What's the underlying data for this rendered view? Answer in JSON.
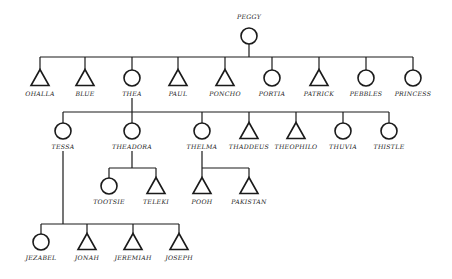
{
  "legend": {
    "circle": "female",
    "triangle": "male"
  },
  "root": {
    "name": "PEGGY",
    "shape": "circle",
    "x": 249,
    "y": 36
  },
  "generations": [
    {
      "bar_y": 57,
      "symbol_y": 78,
      "label_y": 96,
      "parent": "PEGGY",
      "members": [
        {
          "name": "OHALLA",
          "shape": "triangle",
          "x": 40
        },
        {
          "name": "BLUE",
          "shape": "triangle",
          "x": 85
        },
        {
          "name": "THEA",
          "shape": "circle",
          "x": 132
        },
        {
          "name": "PAUL",
          "shape": "triangle",
          "x": 178
        },
        {
          "name": "PONCHO",
          "shape": "triangle",
          "x": 225
        },
        {
          "name": "PORTIA",
          "shape": "circle",
          "x": 272
        },
        {
          "name": "PATRICK",
          "shape": "triangle",
          "x": 319
        },
        {
          "name": "PEBBLES",
          "shape": "circle",
          "x": 366
        },
        {
          "name": "PRINCESS",
          "shape": "circle",
          "x": 413
        }
      ]
    },
    {
      "bar_y": 112,
      "symbol_y": 131,
      "label_y": 149,
      "parent": "THEA",
      "members": [
        {
          "name": "TESSA",
          "shape": "circle",
          "x": 63
        },
        {
          "name": "THEADORA",
          "shape": "circle",
          "x": 132
        },
        {
          "name": "THELMA",
          "shape": "circle",
          "x": 202
        },
        {
          "name": "THADDEUS",
          "shape": "triangle",
          "x": 249
        },
        {
          "name": "THEOPHILO",
          "shape": "triangle",
          "x": 296
        },
        {
          "name": "THUVIA",
          "shape": "circle",
          "x": 343
        },
        {
          "name": "THISTLE",
          "shape": "circle",
          "x": 389
        }
      ]
    },
    {
      "bar_y": 168,
      "symbol_y": 186,
      "label_y": 204,
      "parent": "THEADORA",
      "members": [
        {
          "name": "TOOTSIE",
          "shape": "circle",
          "x": 109
        },
        {
          "name": "TELEKI",
          "shape": "triangle",
          "x": 156
        }
      ]
    },
    {
      "bar_y": 168,
      "symbol_y": 186,
      "label_y": 204,
      "parent": "THELMA",
      "members": [
        {
          "name": "POOH",
          "shape": "triangle",
          "x": 202
        },
        {
          "name": "PAKISTAN",
          "shape": "triangle",
          "x": 249
        }
      ]
    },
    {
      "bar_y": 224,
      "symbol_y": 242,
      "label_y": 260,
      "parent": "TESSA",
      "members": [
        {
          "name": "JEZABEL",
          "shape": "circle",
          "x": 41
        },
        {
          "name": "JONAH",
          "shape": "triangle",
          "x": 87
        },
        {
          "name": "JEREMIAH",
          "shape": "triangle",
          "x": 133
        },
        {
          "name": "JOSEPH",
          "shape": "triangle",
          "x": 179
        }
      ]
    }
  ]
}
